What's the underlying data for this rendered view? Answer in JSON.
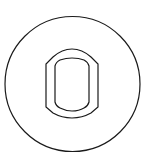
{
  "figure": {
    "description": "Line drawing: circle enclosing a double-outlined rounded rectangular ring",
    "stroke_color": "#1a1a1a",
    "background": "#ffffff",
    "outer_circle": {
      "cx": 72,
      "cy": 84,
      "r": 68
    },
    "outer_ring": {
      "x1": 46,
      "y1": 49,
      "x2": 98,
      "y2": 118
    },
    "inner_ring": {
      "x1": 55,
      "y1": 58,
      "x2": 89,
      "y2": 110
    }
  }
}
